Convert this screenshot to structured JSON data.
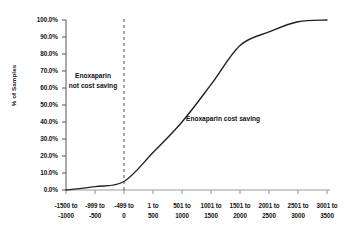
{
  "chart_data": {
    "type": "line",
    "title": "",
    "xlabel": "",
    "ylabel": "% of Samples",
    "ylim": [
      0,
      100
    ],
    "grid": false,
    "legend": null,
    "categories": [
      "-1500 to -1000",
      "-999 to -500",
      "-499 to 0",
      "1 to 500",
      "501 to 1000",
      "1001 to 1500",
      "1501 to 2000",
      "2001 to 2500",
      "2501 to 3000",
      "3001 to 3500"
    ],
    "series": [
      {
        "name": "Cumulative % of samples",
        "values": [
          0.0,
          2.0,
          5.0,
          22.0,
          40.0,
          62.0,
          85.0,
          93.0,
          99.0,
          100.0
        ]
      }
    ],
    "annotations": [
      {
        "name": "not-cost-saving",
        "text_line1": "Enoxaparin",
        "text_line2": "not cost saving",
        "region": "left of threshold"
      },
      {
        "name": "cost-saving",
        "text": "Enoxaparin cost saving",
        "region": "right of threshold"
      }
    ],
    "threshold_line": {
      "name": "zero-cost-threshold",
      "at_category": "-499 to 0",
      "style": "dashed",
      "color": "#555555"
    },
    "line_color": "#222222"
  },
  "axes": {
    "y_ticks": [
      "100.0%",
      "90.0%",
      "80.0%",
      "70.0%",
      "60.0%",
      "50.0%",
      "40.0%",
      "30.0%",
      "20.0%",
      "10.0%",
      "0.0%"
    ],
    "y_title": "% of Samples",
    "x_ticks": [
      {
        "top": "-1500 to",
        "bottom": "-1000"
      },
      {
        "top": "-999 to",
        "bottom": "-500"
      },
      {
        "top": "-499 to",
        "bottom": "0"
      },
      {
        "top": "1 to",
        "bottom": "500"
      },
      {
        "top": "501 to",
        "bottom": "1000"
      },
      {
        "top": "1001 to",
        "bottom": "1500"
      },
      {
        "top": "1501 to",
        "bottom": "2000"
      },
      {
        "top": "2001 to",
        "bottom": "2500"
      },
      {
        "top": "2501 to",
        "bottom": "3000"
      },
      {
        "top": "3001 to",
        "bottom": "3500"
      }
    ]
  },
  "annotations": {
    "left_line1": "Enoxaparin",
    "left_line2": "not cost saving",
    "right": "Enoxaparin cost saving"
  }
}
